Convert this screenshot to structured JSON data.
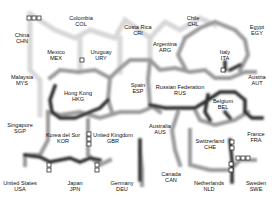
{
  "diagram": {
    "type": "self-organizing-map-umatrix",
    "colors": {
      "background": "#ffffff",
      "boundary_dark": "#1a1a1a",
      "boundary_mid": "#8a8a8a",
      "boundary_light": "#d6d6d6"
    },
    "nodes": [
      {
        "name": "Colombia",
        "code": "COL",
        "x": 81,
        "y": 21
      },
      {
        "name": "Costa Rica",
        "code": "CRI",
        "x": 138,
        "y": 30
      },
      {
        "name": "Chile",
        "code": "CHL",
        "x": 193,
        "y": 21
      },
      {
        "name": "Egypt",
        "code": "EGY",
        "x": 257,
        "y": 30
      },
      {
        "name": "China",
        "code": "CHN",
        "x": 22,
        "y": 38
      },
      {
        "name": "Mexico",
        "code": "MEX",
        "x": 56,
        "y": 55
      },
      {
        "name": "Uruguay",
        "code": "URY",
        "x": 101,
        "y": 55
      },
      {
        "name": "Argentina",
        "code": "ARG",
        "x": 165,
        "y": 47
      },
      {
        "name": "Italy",
        "code": "ITA",
        "x": 225,
        "y": 55
      },
      {
        "name": "Malaysia",
        "code": "MYS",
        "x": 22,
        "y": 80
      },
      {
        "name": "Spain",
        "code": "ESP",
        "x": 138,
        "y": 88
      },
      {
        "name": "Austria",
        "code": "AUT",
        "x": 257,
        "y": 80
      },
      {
        "name": "Hong Kong",
        "code": "HKG",
        "x": 78,
        "y": 96
      },
      {
        "name": "Russian Federation",
        "code": "RUS",
        "x": 180,
        "y": 90
      },
      {
        "name": "Belgium",
        "code": "BEL",
        "x": 223,
        "y": 104
      },
      {
        "name": "Singapore",
        "code": "SGP",
        "x": 20,
        "y": 128
      },
      {
        "name": "Korea del Sur",
        "code": "KOR",
        "x": 63,
        "y": 138
      },
      {
        "name": "United Kingdom",
        "code": "GBR",
        "x": 113,
        "y": 138
      },
      {
        "name": "Australia",
        "code": "AUS",
        "x": 160,
        "y": 129
      },
      {
        "name": "Switzerland",
        "code": "CHE",
        "x": 210,
        "y": 144
      },
      {
        "name": "France",
        "code": "FRA",
        "x": 256,
        "y": 137
      },
      {
        "name": "Canada",
        "code": "CAN",
        "x": 171,
        "y": 177
      },
      {
        "name": "United States",
        "code": "USA",
        "x": 20,
        "y": 186
      },
      {
        "name": "Japan",
        "code": "JPN",
        "x": 75,
        "y": 186
      },
      {
        "name": "Germany",
        "code": "DEU",
        "x": 122,
        "y": 186
      },
      {
        "name": "Netherlands",
        "code": "NLD",
        "x": 209,
        "y": 186
      },
      {
        "name": "Sweden",
        "code": "SWE",
        "x": 256,
        "y": 186
      }
    ]
  }
}
